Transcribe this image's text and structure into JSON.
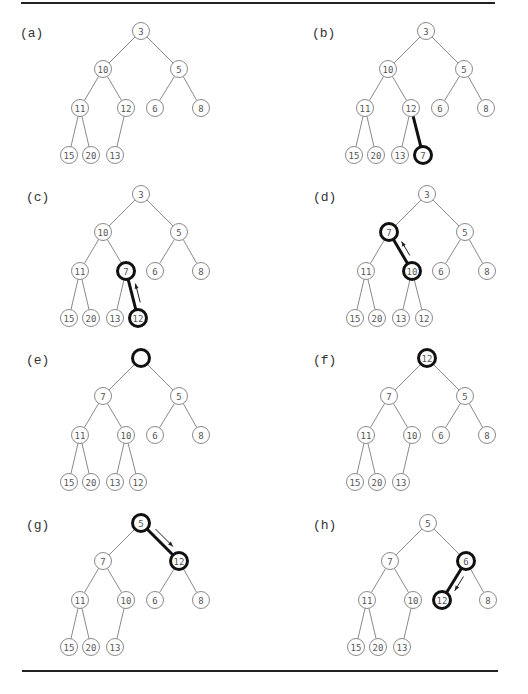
{
  "figure": {
    "panels": [
      {
        "label": "(a)",
        "nodes": {
          "n0": "3",
          "n1": "10",
          "n2": "5",
          "n3": "11",
          "n4": "12",
          "n5": "6",
          "n6": "8",
          "n7": "15",
          "n8": "20",
          "n9": "13"
        },
        "bold_nodes": [],
        "bold_edges": [],
        "arrow": null
      },
      {
        "label": "(b)",
        "nodes": {
          "n0": "3",
          "n1": "10",
          "n2": "5",
          "n3": "11",
          "n4": "12",
          "n5": "6",
          "n6": "8",
          "n7": "15",
          "n8": "20",
          "n9": "13",
          "n10": "7"
        },
        "bold_nodes": [
          "n10"
        ],
        "bold_edges": [
          [
            "n4",
            "n10"
          ]
        ],
        "arrow": null
      },
      {
        "label": "(c)",
        "nodes": {
          "n0": "3",
          "n1": "10",
          "n2": "5",
          "n3": "11",
          "n4": "7",
          "n5": "6",
          "n6": "8",
          "n7": "15",
          "n8": "20",
          "n9": "13",
          "n10": "12"
        },
        "bold_nodes": [
          "n4",
          "n10"
        ],
        "bold_edges": [
          [
            "n4",
            "n10"
          ]
        ],
        "arrow": {
          "from": "n10",
          "to": "n4",
          "direction": "up"
        }
      },
      {
        "label": "(d)",
        "nodes": {
          "n0": "3",
          "n1": "7",
          "n2": "5",
          "n3": "11",
          "n4": "10",
          "n5": "6",
          "n6": "8",
          "n7": "15",
          "n8": "20",
          "n9": "13",
          "n10": "12"
        },
        "bold_nodes": [
          "n1",
          "n4"
        ],
        "bold_edges": [
          [
            "n1",
            "n4"
          ]
        ],
        "arrow": {
          "from": "n4",
          "to": "n1",
          "direction": "up"
        }
      },
      {
        "label": "(e)",
        "nodes": {
          "n0": "",
          "n1": "7",
          "n2": "5",
          "n3": "11",
          "n4": "10",
          "n5": "6",
          "n6": "8",
          "n7": "15",
          "n8": "20",
          "n9": "13",
          "n10": "12"
        },
        "bold_nodes": [
          "n0"
        ],
        "bold_edges": [],
        "arrow": null
      },
      {
        "label": "(f)",
        "nodes": {
          "n0": "12",
          "n1": "7",
          "n2": "5",
          "n3": "11",
          "n4": "10",
          "n5": "6",
          "n6": "8",
          "n7": "15",
          "n8": "20",
          "n9": "13"
        },
        "bold_nodes": [
          "n0"
        ],
        "bold_edges": [],
        "arrow": null
      },
      {
        "label": "(g)",
        "nodes": {
          "n0": "5",
          "n1": "7",
          "n2": "12",
          "n3": "11",
          "n4": "10",
          "n5": "6",
          "n6": "8",
          "n7": "15",
          "n8": "20",
          "n9": "13"
        },
        "bold_nodes": [
          "n0",
          "n2"
        ],
        "bold_edges": [
          [
            "n0",
            "n2"
          ]
        ],
        "arrow": {
          "from": "n0",
          "to": "n2",
          "direction": "down"
        }
      },
      {
        "label": "(h)",
        "nodes": {
          "n0": "5",
          "n1": "7",
          "n2": "6",
          "n3": "11",
          "n4": "10",
          "n5": "12",
          "n6": "8",
          "n7": "15",
          "n8": "20",
          "n9": "13"
        },
        "bold_nodes": [
          "n2",
          "n5"
        ],
        "bold_edges": [
          [
            "n2",
            "n5"
          ]
        ],
        "arrow": {
          "from": "n2",
          "to": "n5",
          "direction": "down"
        }
      }
    ]
  }
}
